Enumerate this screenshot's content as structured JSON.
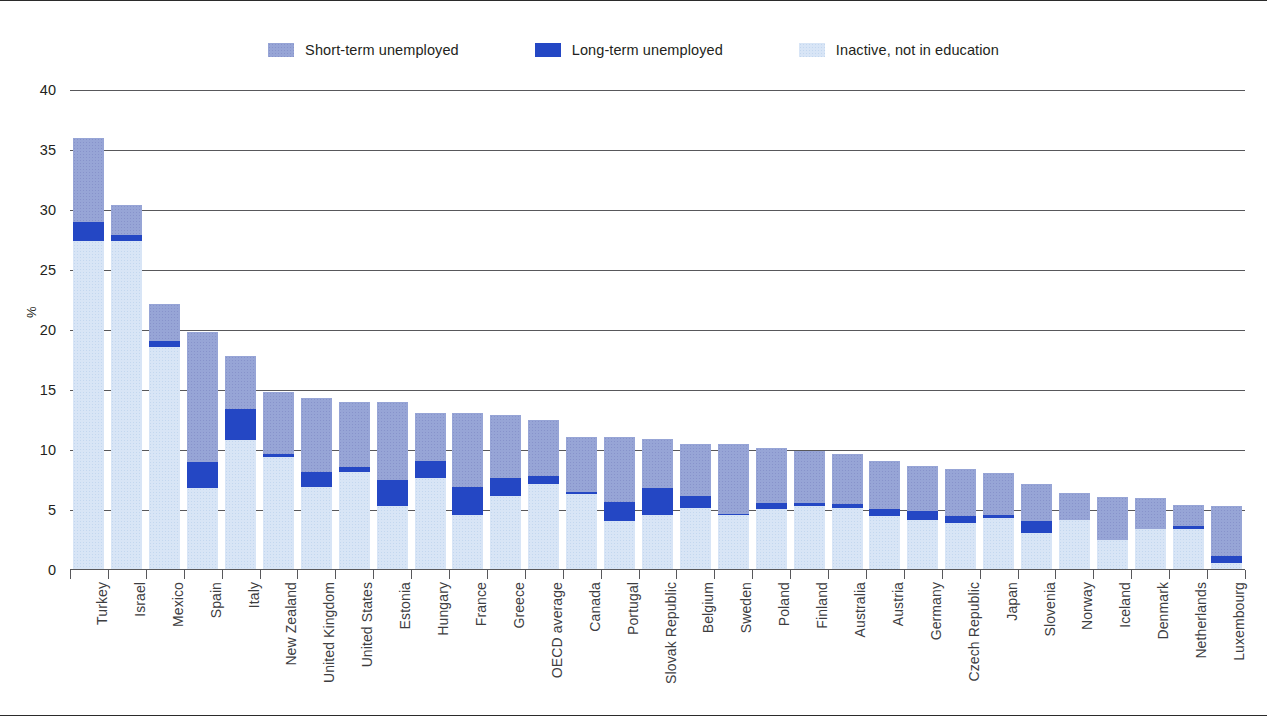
{
  "legend": {
    "items": [
      {
        "label": "Short-term unemployed",
        "color": "#97a5d6",
        "key": "short"
      },
      {
        "label": "Long-term unemployed",
        "color": "#2447c4",
        "key": "long"
      },
      {
        "label": "Inactive, not in education",
        "color": "#d8e5f6",
        "key": "inactive"
      }
    ]
  },
  "axis": {
    "ylabel": "%",
    "yticks": [
      "0",
      "5",
      "10",
      "15",
      "20",
      "25",
      "30",
      "35",
      "40"
    ]
  },
  "chart_data": {
    "type": "bar",
    "title": "",
    "subtitle": "",
    "xlabel": "",
    "ylabel": "%",
    "ylim": [
      0,
      40
    ],
    "ytick_step": 5,
    "grid": true,
    "stacked": true,
    "legend_position": "top",
    "colors": {
      "short": "#97a5d6",
      "long": "#2447c4",
      "inactive": "#d8e5f6"
    },
    "categories": [
      "Turkey",
      "Israel",
      "Mexico",
      "Spain",
      "Italy",
      "New Zealand",
      "United Kingdom",
      "United States",
      "Estonia",
      "Hungary",
      "France",
      "Greece",
      "OECD average",
      "Canada",
      "Portugal",
      "Slovak Republic",
      "Belgium",
      "Sweden",
      "Poland",
      "Finland",
      "Australia",
      "Austria",
      "Germany",
      "Czech Republic",
      "Japan",
      "Slovenia",
      "Norway",
      "Iceland",
      "Denmark",
      "Netherlands",
      "Luxembourg"
    ],
    "series": [
      {
        "name": "Inactive, not in education",
        "key": "inactive",
        "values": [
          27.4,
          27.4,
          18.6,
          6.8,
          10.8,
          9.4,
          6.9,
          8.2,
          5.3,
          7.7,
          4.6,
          6.2,
          7.2,
          6.3,
          4.1,
          4.6,
          5.2,
          4.6,
          5.1,
          5.3,
          5.2,
          4.5,
          4.2,
          3.9,
          4.3,
          3.1,
          4.2,
          2.5,
          3.4,
          3.4,
          0.6
        ]
      },
      {
        "name": "Long-term unemployed",
        "key": "long",
        "values": [
          1.6,
          0.5,
          0.5,
          2.2,
          2.6,
          0.3,
          1.3,
          0.4,
          2.2,
          1.4,
          2.3,
          1.5,
          0.6,
          0.2,
          1.6,
          2.2,
          1.0,
          0.1,
          0.5,
          0.3,
          0.3,
          0.6,
          0.7,
          0.6,
          0.3,
          1.0,
          0.0,
          0.0,
          0.0,
          0.3,
          0.6
        ]
      },
      {
        "name": "Short-term unemployed",
        "key": "short",
        "values": [
          7.0,
          2.5,
          3.1,
          10.8,
          4.4,
          5.1,
          6.1,
          5.4,
          6.5,
          4.0,
          6.2,
          5.2,
          4.7,
          4.6,
          5.4,
          4.1,
          4.3,
          5.8,
          4.6,
          4.3,
          4.2,
          4.0,
          3.8,
          3.9,
          3.5,
          3.1,
          2.2,
          3.6,
          2.6,
          1.7,
          4.1
        ]
      }
    ],
    "totals": [
      36.0,
      30.4,
      22.2,
      19.8,
      17.8,
      14.8,
      14.3,
      14.0,
      14.0,
      13.1,
      13.1,
      12.9,
      12.5,
      11.1,
      11.1,
      10.9,
      10.5,
      10.5,
      10.2,
      9.9,
      9.7,
      9.1,
      8.7,
      8.4,
      8.1,
      7.2,
      6.4,
      6.1,
      6.0,
      5.4,
      5.3
    ]
  }
}
